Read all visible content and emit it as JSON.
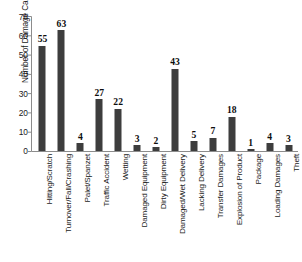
{
  "chart_data": {
    "type": "bar",
    "title": "",
    "subtitle": "",
    "xlabel": "",
    "ylabel": "Number of Damage Cases",
    "ylim": [
      0,
      70
    ],
    "ytick_step": 10,
    "yticks": [
      0,
      10,
      20,
      30,
      40,
      50,
      60,
      70
    ],
    "ytick_labels": [
      "0",
      "10",
      "20",
      "30",
      "40",
      "50",
      "60",
      "70"
    ],
    "grid": false,
    "legend": false,
    "legend_position": "none",
    "bar_color": "#3d3d3d",
    "axis_color": "#808080",
    "data_labels_shown": true,
    "xtick_label_rotation": 90,
    "categories": [
      "Hitting/Scratch",
      "Turnover/Fall/Crashing",
      "Palet/Spanzet",
      "Traffic Accident",
      "Wetting",
      "Damaged Equipment",
      "Dirty Equipment",
      "Damaged/Wet Delivery",
      "Lacking Delivery",
      "Transfer Damages",
      "Explosion of Product",
      "Package",
      "Loading Damages",
      "Theft"
    ],
    "values": [
      55,
      63,
      4,
      27,
      22,
      3,
      2,
      43,
      5,
      7,
      18,
      1,
      4,
      3
    ],
    "value_labels": [
      "55",
      "63",
      "4",
      "27",
      "22",
      "3",
      "2",
      "43",
      "5",
      "7",
      "18",
      "1",
      "4",
      "3"
    ]
  }
}
